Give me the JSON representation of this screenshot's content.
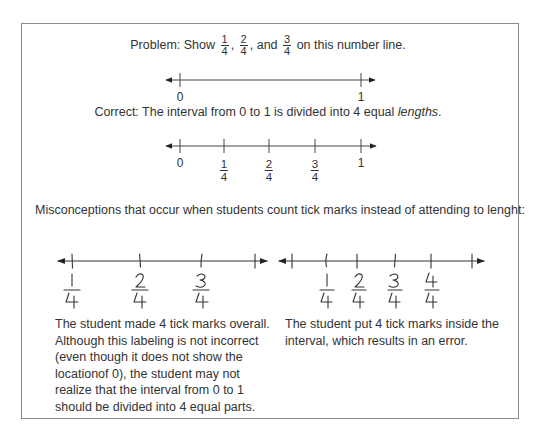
{
  "problem": {
    "prefix": "Problem: Show",
    "fractions": [
      {
        "num": "1",
        "den": "4",
        "sep": ","
      },
      {
        "num": "2",
        "den": "4",
        "sep": ", and"
      },
      {
        "num": "3",
        "den": "4",
        "sep": ""
      }
    ],
    "suffix": "on this number line.",
    "number_line": {
      "labels": [
        "0",
        "1"
      ]
    }
  },
  "correct": {
    "text": "Correct: The interval from 0 to 1 is divided into 4 equal",
    "emphasis": "lengths",
    "end": ".",
    "number_line": {
      "labels": [
        {
          "whole": "0"
        },
        {
          "num": "1",
          "den": "4"
        },
        {
          "num": "2",
          "den": "4"
        },
        {
          "num": "3",
          "den": "4"
        },
        {
          "whole": "1"
        }
      ]
    }
  },
  "misconceptions": {
    "heading": "Misconceptions that occur when students count tick marks instead of attending to lenght:",
    "examples": [
      {
        "labels": [
          {
            "num": "1",
            "den": "4"
          },
          {
            "num": "2",
            "den": "4"
          },
          {
            "num": "3",
            "den": "4"
          }
        ],
        "description": "The student made 4 tick marks overall. Although this labeling is not incorrect (even though it does not show the locationof 0), the student may not realize that the interval from 0 to 1 should be divided into 4 equal parts."
      },
      {
        "labels": [
          {
            "num": "1",
            "den": "4"
          },
          {
            "num": "2",
            "den": "4"
          },
          {
            "num": "3",
            "den": "4"
          },
          {
            "num": "4",
            "den": "4"
          }
        ],
        "description": "The student put 4 tick marks inside the interval, which results in an error."
      }
    ]
  },
  "colors": {
    "text": "#333333",
    "line": "#333333",
    "frame": "#8a8a8a",
    "background": "#ffffff"
  }
}
